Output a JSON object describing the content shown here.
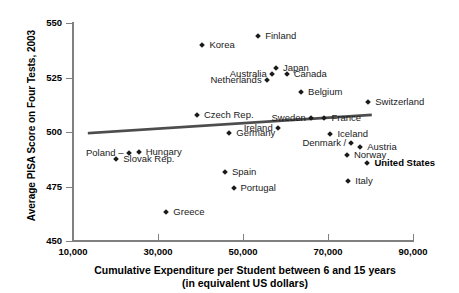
{
  "chart_data": {
    "type": "scatter",
    "title": "",
    "xlabel": "Cumulative Expenditure per Student between 6 and 15 years",
    "xlabel_line2": "(in equivalent US dollars)",
    "ylabel": "Average PISA Score on Four Tests, 2003",
    "xlim": [
      10000,
      90000
    ],
    "ylim": [
      450,
      550
    ],
    "xticks": [
      "10,000",
      "30,000",
      "50,000",
      "70,000",
      "90,000"
    ],
    "xtick_values": [
      10000,
      30000,
      50000,
      70000,
      90000
    ],
    "yticks": [
      "450",
      "475",
      "500",
      "525",
      "550"
    ],
    "ytick_values": [
      450,
      475,
      500,
      525,
      550
    ],
    "grid": false,
    "legend": "none",
    "marker_color": "#1a1a1a",
    "trendline_color": "#4d4d4d",
    "axis_color": "#808080",
    "points": [
      {
        "name": "Finland",
        "x": 53800,
        "y": 543.5,
        "label_pos": "right"
      },
      {
        "name": "Korea",
        "x": 40700,
        "y": 539.5,
        "label_pos": "right"
      },
      {
        "name": "Japan",
        "x": 58000,
        "y": 529.0,
        "label_pos": "right"
      },
      {
        "name": "Canada",
        "x": 60500,
        "y": 526.0,
        "label_pos": "right"
      },
      {
        "name": "Australia",
        "x": 57000,
        "y": 526.0,
        "label_pos": "left"
      },
      {
        "name": "Netherlands",
        "x": 55800,
        "y": 523.5,
        "label_pos": "left"
      },
      {
        "name": "Belgium",
        "x": 63900,
        "y": 518.0,
        "label_pos": "right"
      },
      {
        "name": "Switzerland",
        "x": 79700,
        "y": 513.5,
        "label_pos": "right"
      },
      {
        "name": "Czech Rep.",
        "x": 39400,
        "y": 507.5,
        "label_pos": "right"
      },
      {
        "name": "Sweden",
        "x": 66200,
        "y": 506.0,
        "label_pos": "left"
      },
      {
        "name": "France",
        "x": 69400,
        "y": 506.0,
        "label_pos": "right"
      },
      {
        "name": "Ireland",
        "x": 58400,
        "y": 501.5,
        "label_pos": "left"
      },
      {
        "name": "Germany",
        "x": 47000,
        "y": 499.0,
        "label_pos": "right"
      },
      {
        "name": "Iceland",
        "x": 70800,
        "y": 498.5,
        "label_pos": "right"
      },
      {
        "name": "Denmark",
        "x": 75700,
        "y": 494.5,
        "label_pos": "left-dash"
      },
      {
        "name": "Austria",
        "x": 77800,
        "y": 492.5,
        "label_pos": "right"
      },
      {
        "name": "Norway",
        "x": 74700,
        "y": 489.0,
        "label_pos": "right"
      },
      {
        "name": "United States",
        "x": 79500,
        "y": 485.5,
        "label_pos": "right",
        "bold": true
      },
      {
        "name": "Hungary",
        "x": 25700,
        "y": 490.5,
        "label_pos": "right"
      },
      {
        "name": "Poland",
        "x": 23300,
        "y": 490.0,
        "label_pos": "left-dash"
      },
      {
        "name": "Slovak Rep.",
        "x": 20400,
        "y": 487.0,
        "label_pos": "right"
      },
      {
        "name": "Spain",
        "x": 46000,
        "y": 481.0,
        "label_pos": "right"
      },
      {
        "name": "Italy",
        "x": 75000,
        "y": 477.0,
        "label_pos": "right"
      },
      {
        "name": "Portugal",
        "x": 48000,
        "y": 474.0,
        "label_pos": "right"
      },
      {
        "name": "Greece",
        "x": 32200,
        "y": 463.0,
        "label_pos": "right"
      }
    ],
    "trendline": {
      "x0": 13800,
      "y0": 499.5,
      "x1": 80000,
      "y1": 507.8
    }
  }
}
